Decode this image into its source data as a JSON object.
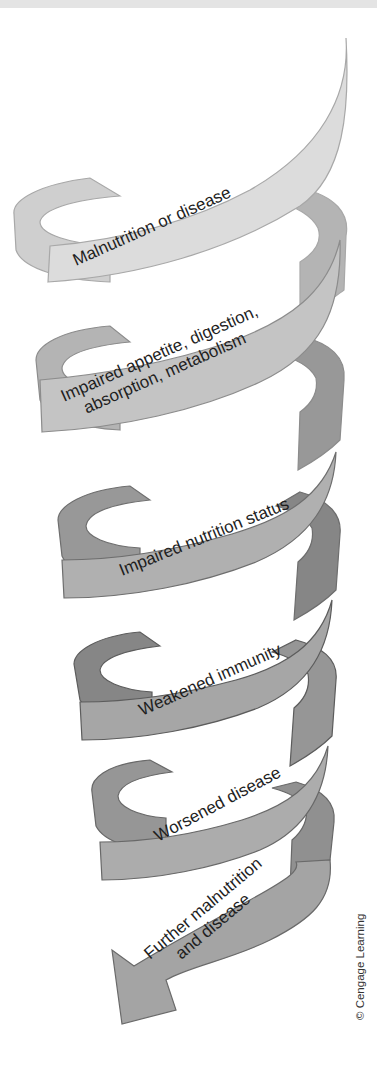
{
  "diagram": {
    "stages": [
      {
        "lines": [
          "Malnutrition or disease"
        ],
        "color": "#dcdcdc",
        "back": "#cfcfcf",
        "edge": "#a8a8a8"
      },
      {
        "lines": [
          "Impaired appetite, digestion,",
          "absorption, metabolism"
        ],
        "color": "#c4c4c4",
        "back": "#b4b4b4",
        "edge": "#8c8c8c"
      },
      {
        "lines": [
          "Impaired nutrition status"
        ],
        "color": "#b0b0b0",
        "back": "#989898",
        "edge": "#6e6e6e"
      },
      {
        "lines": [
          "Weakened immunity"
        ],
        "color": "#a6a6a6",
        "back": "#868686",
        "edge": "#5c5c5c"
      },
      {
        "lines": [
          "Worsened disease"
        ],
        "color": "#acacac",
        "back": "#969696",
        "edge": "#686868"
      },
      {
        "lines": [
          "Further malnutrition",
          "and disease"
        ],
        "color": "#a4a4a4",
        "back": "#909090",
        "edge": "#6a6a6a"
      }
    ],
    "end_marker": "arrow-down-left",
    "credit": "© Cengage Learning"
  }
}
